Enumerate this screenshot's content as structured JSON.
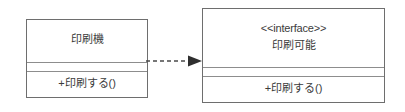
{
  "diagram": {
    "type": "uml-class-diagram",
    "background_color": "#ffffff",
    "line_color": "#6e6e6e",
    "text_color": "#3b3b3b",
    "classes": [
      {
        "id": "printer",
        "stereotype": "",
        "name": "印刷機",
        "attributes": [],
        "operations": [
          "+印刷する()"
        ]
      },
      {
        "id": "printable",
        "stereotype": "<<interface>>",
        "name": "印刷可能",
        "attributes": [],
        "operations": [
          "+印刷する()"
        ]
      }
    ],
    "relationship": {
      "name": "realization",
      "line_style": "dashed",
      "arrowhead": "filled-triangle",
      "direction": "left-to-right",
      "source": "印刷機",
      "target": "印刷可能",
      "label": ""
    }
  }
}
